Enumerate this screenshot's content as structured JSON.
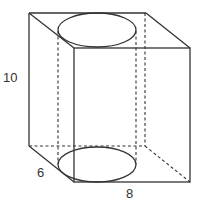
{
  "diagram": {
    "labels": {
      "height": "10",
      "depth": "6",
      "width": "8"
    },
    "colors": {
      "stroke": "#333333",
      "background": "#ffffff"
    }
  }
}
